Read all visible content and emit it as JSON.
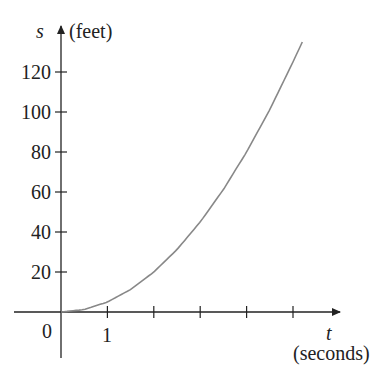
{
  "chart_data": {
    "type": "line",
    "title": "",
    "xlabel_symbol": "t",
    "xlabel_unit": "(seconds)",
    "ylabel_symbol": "s",
    "ylabel_unit": "(feet)",
    "x_tick_labels": [
      "0",
      "1"
    ],
    "x_ticks": [
      1,
      2,
      3,
      4,
      5
    ],
    "y_tick_labels": [
      "20",
      "40",
      "60",
      "80",
      "100",
      "120"
    ],
    "y_ticks": [
      20,
      40,
      60,
      80,
      100,
      120
    ],
    "xlim": [
      -1,
      6
    ],
    "ylim": [
      -20,
      145
    ],
    "grid": false,
    "legend": "none",
    "series": [
      {
        "name": "s(t)",
        "x": [
          0,
          0.5,
          1,
          1.5,
          2,
          2.5,
          3,
          3.5,
          4,
          4.5,
          5,
          5.2
        ],
        "values": [
          0,
          1.25,
          5,
          11.25,
          20,
          31.25,
          45,
          61.25,
          80,
          101.25,
          125,
          135
        ]
      }
    ],
    "colors": {
      "axis": "#222222",
      "curve": "#888888"
    }
  }
}
